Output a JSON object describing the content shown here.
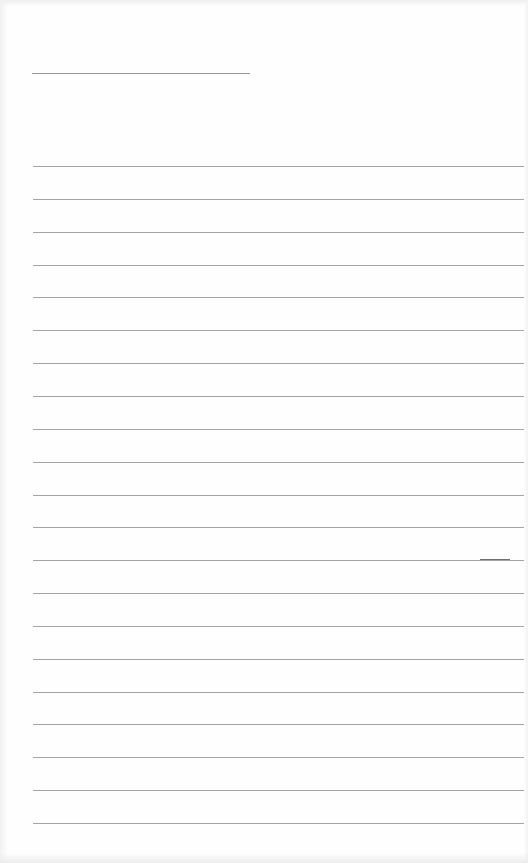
{
  "page": {
    "type": "blank-lined-paper",
    "width": 528,
    "height": 863,
    "background_color": "#fefefe",
    "line_color": "#a4a4a4"
  },
  "title_line": {
    "x": 32,
    "y": 73,
    "width": 218
  },
  "ruled_lines": {
    "x_start": 33,
    "x_end": 524,
    "first_y": 166,
    "spacing": 32.85,
    "count": 21
  },
  "marks": [
    {
      "x": 480,
      "y": 559,
      "width": 30
    }
  ]
}
